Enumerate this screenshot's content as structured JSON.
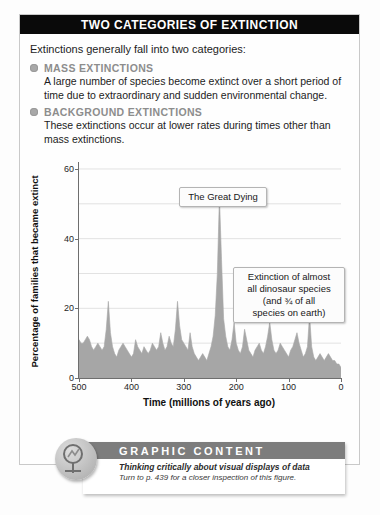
{
  "panel": {
    "title": "TWO CATEGORIES OF EXTINCTION",
    "intro": "Extinctions generally fall into two categories:",
    "categories": [
      {
        "title": "MASS EXTINCTIONS",
        "body": "A large number of species become extinct over a short period of time due to extraordinary and sudden environmental change."
      },
      {
        "title": "BACKGROUND EXTINCTIONS",
        "body": "These extinctions occur at lower rates during times other than mass extinctions."
      }
    ]
  },
  "footer": {
    "banner_title": "GRAPHIC CONTENT",
    "subtitle_1": "Thinking critically about visual displays of data",
    "subtitle_2": "Turn to p. 439 for a closer inspection of this figure."
  },
  "chart_data": {
    "type": "area",
    "title": "",
    "xlabel": "Time  (millions of years ago)",
    "ylabel": "Percentage of families that became extinct",
    "xlim": [
      500,
      0
    ],
    "ylim": [
      0,
      62
    ],
    "x_ticks": [
      500,
      400,
      300,
      200,
      100,
      0
    ],
    "y_ticks": [
      0,
      20,
      40,
      60
    ],
    "y_gridlines": [
      10,
      20,
      30,
      40,
      50,
      60
    ],
    "grid": true,
    "x_reversed": true,
    "legend": "none",
    "fill_color": "#a6a6a6",
    "annotations": [
      {
        "name": "the-great-dying",
        "text": "The Great Dying",
        "at_x": 252,
        "at_y": 52
      },
      {
        "name": "dinosaur-extinction",
        "text": "Extinction of almost all dinosaur species (and ¾ of all species on earth)",
        "lines": [
          "Extinction of almost",
          "all dinosaur species",
          "(and ¾ of all",
          "species on earth)"
        ],
        "at_x": 65,
        "at_y": 18
      }
    ],
    "x": [
      500,
      496,
      492,
      488,
      484,
      480,
      476,
      472,
      468,
      464,
      460,
      456,
      452,
      448,
      444,
      440,
      436,
      432,
      428,
      424,
      420,
      416,
      412,
      408,
      404,
      400,
      396,
      392,
      388,
      384,
      380,
      376,
      372,
      368,
      364,
      360,
      356,
      352,
      348,
      344,
      340,
      336,
      332,
      328,
      324,
      320,
      316,
      312,
      308,
      304,
      300,
      296,
      292,
      288,
      284,
      280,
      276,
      272,
      268,
      264,
      260,
      256,
      252,
      248,
      244,
      240,
      236,
      232,
      228,
      224,
      220,
      216,
      212,
      208,
      204,
      200,
      196,
      192,
      188,
      184,
      180,
      176,
      172,
      168,
      164,
      160,
      156,
      152,
      148,
      144,
      140,
      136,
      132,
      128,
      124,
      120,
      116,
      112,
      108,
      104,
      100,
      96,
      92,
      88,
      84,
      80,
      76,
      72,
      68,
      64,
      60,
      56,
      52,
      48,
      44,
      40,
      36,
      32,
      28,
      24,
      20,
      16,
      12,
      8,
      4,
      0
    ],
    "values": [
      11,
      10,
      10,
      11,
      12,
      11,
      9,
      8,
      9,
      10,
      9,
      8,
      9,
      14,
      22,
      13,
      9,
      7,
      6,
      8,
      9,
      10,
      9,
      8,
      7,
      6,
      7,
      11,
      9,
      8,
      7,
      9,
      8,
      7,
      8,
      10,
      9,
      8,
      9,
      13,
      10,
      8,
      9,
      12,
      10,
      9,
      14,
      22,
      15,
      11,
      10,
      9,
      8,
      13,
      9,
      7,
      6,
      5,
      6,
      7,
      6,
      5,
      7,
      9,
      12,
      18,
      30,
      52,
      34,
      17,
      12,
      9,
      8,
      11,
      16,
      10,
      8,
      7,
      9,
      14,
      11,
      8,
      7,
      6,
      8,
      9,
      10,
      8,
      7,
      9,
      12,
      16,
      11,
      8,
      7,
      8,
      10,
      9,
      8,
      7,
      6,
      8,
      9,
      11,
      13,
      10,
      8,
      6,
      7,
      9,
      18,
      9,
      6,
      5,
      6,
      7,
      6,
      5,
      6,
      7,
      6,
      5,
      5,
      4,
      4,
      3
    ]
  }
}
